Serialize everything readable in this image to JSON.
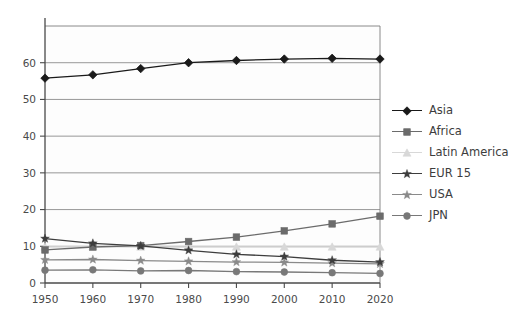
{
  "chart_data": {
    "type": "line",
    "title": "",
    "xlabel": "",
    "ylabel": "",
    "x": [
      1950,
      1960,
      1970,
      1980,
      1990,
      2000,
      2010,
      2020
    ],
    "xticklabels": [
      "1950",
      "1960",
      "1970",
      "1980",
      "1990",
      "2000",
      "2010",
      "2020"
    ],
    "yticks": [
      0,
      10,
      20,
      30,
      40,
      50,
      60
    ],
    "yticklabels": [
      "0",
      "10",
      "20",
      "30",
      "40",
      "50",
      "60"
    ],
    "ylim": [
      0,
      70
    ],
    "xlim": [
      1950,
      2020
    ],
    "grid": "horizontal",
    "legend_position": "right",
    "series": [
      {
        "name": "Asia",
        "color": "#1a1a1a",
        "marker": "diamond",
        "values": [
          55.8,
          56.7,
          58.4,
          60.0,
          60.6,
          61.0,
          61.2,
          61.0
        ]
      },
      {
        "name": "Africa",
        "color": "#6b6b6b",
        "marker": "square",
        "values": [
          9.0,
          9.8,
          10.2,
          11.3,
          12.5,
          14.2,
          16.1,
          18.2
        ]
      },
      {
        "name": "Latin America",
        "color": "#d8d8d8",
        "marker": "triangle",
        "values": [
          9.8,
          9.9,
          9.8,
          9.8,
          9.8,
          9.8,
          9.8,
          9.8
        ]
      },
      {
        "name": "EUR 15",
        "color": "#3d3d3d",
        "marker": "star",
        "values": [
          12.1,
          10.8,
          10.1,
          8.9,
          7.8,
          7.2,
          6.2,
          5.7
        ]
      },
      {
        "name": "USA",
        "color": "#8a8a8a",
        "marker": "star",
        "values": [
          6.3,
          6.4,
          6.1,
          5.9,
          5.7,
          5.6,
          5.4,
          5.2
        ]
      },
      {
        "name": "JPN",
        "color": "#787878",
        "marker": "circle",
        "values": [
          3.5,
          3.6,
          3.3,
          3.4,
          3.1,
          3.0,
          2.8,
          2.6
        ]
      }
    ]
  },
  "legend": {
    "items": [
      {
        "label": "Asia"
      },
      {
        "label": "Africa"
      },
      {
        "label": "Latin America"
      },
      {
        "label": "EUR 15"
      },
      {
        "label": "USA"
      },
      {
        "label": "JPN"
      }
    ]
  },
  "axes": {
    "frame_color": "#7d7d7d",
    "grid_color": "#8c8c8c"
  }
}
